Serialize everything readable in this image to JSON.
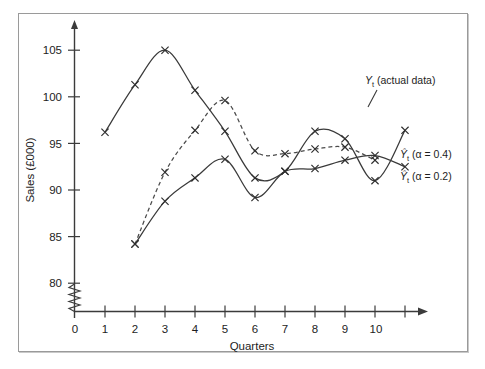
{
  "figure": {
    "background_color": "#ffffff",
    "frame_color": "#9a9a9a",
    "ink_color": "#3a3a3a"
  },
  "axes": {
    "y_title": "Sales (£000)",
    "x_title": "Quarters",
    "y_ticks": [
      "80",
      "85",
      "90",
      "95",
      "100",
      "105"
    ],
    "x_ticks": [
      "0",
      "1",
      "2",
      "3",
      "4",
      "5",
      "6",
      "7",
      "8",
      "9",
      "10"
    ],
    "y_break_symbol": "zigzag",
    "x_arrow": true,
    "y_arrow": true
  },
  "legend": {
    "actual": {
      "symbol": "Y",
      "subscript": "t",
      "text": " (actual data)"
    },
    "alpha04": {
      "symbol": "Ŷ",
      "subscript": "t",
      "text": " (α = 0.4)"
    },
    "alpha02": {
      "symbol": "Ŷ",
      "subscript": "t",
      "text": " (α = 0.2)"
    }
  },
  "chart_data": {
    "type": "line",
    "title": "",
    "subtitle": "",
    "xlabel": "Quarters",
    "ylabel": "Sales (£000)",
    "xlim": [
      0,
      11.6
    ],
    "ylim": [
      79.0,
      106.8
    ],
    "x_tick_values": [
      0,
      1,
      2,
      3,
      4,
      5,
      6,
      7,
      8,
      9,
      10
    ],
    "y_tick_values": [
      80,
      85,
      90,
      95,
      100,
      105
    ],
    "grid": false,
    "legend_position": "right-inline-annotations",
    "axis_break": {
      "axis": "y",
      "below": 80
    },
    "x": [
      1,
      2,
      3,
      4,
      5,
      6,
      7,
      8,
      9,
      10,
      11
    ],
    "series": [
      {
        "name": "Y_t (actual data)",
        "style": "solid",
        "marker": "x",
        "x": [
          1,
          2,
          3,
          4,
          5,
          6,
          7,
          8,
          9,
          10,
          11
        ],
        "values": [
          96.2,
          101.3,
          105.0,
          100.7,
          96.3,
          91.3,
          92.0,
          96.3,
          95.5,
          91.0,
          96.4
        ]
      },
      {
        "name": "Yhat_t (alpha = 0.4)",
        "style": "dashed",
        "marker": "x",
        "x": [
          2,
          3,
          4,
          5,
          6,
          7,
          8,
          9,
          10
        ],
        "values": [
          84.2,
          91.9,
          96.4,
          99.6,
          94.2,
          93.9,
          94.4,
          94.6,
          93.2
        ]
      },
      {
        "name": "Yhat_t (alpha = 0.2)",
        "style": "solid",
        "marker": "x",
        "x": [
          2,
          3,
          4,
          5,
          6,
          7,
          8,
          9,
          10,
          11
        ],
        "values": [
          84.2,
          88.8,
          91.3,
          93.3,
          89.2,
          92.0,
          92.3,
          93.2,
          93.7,
          92.5
        ]
      }
    ]
  }
}
